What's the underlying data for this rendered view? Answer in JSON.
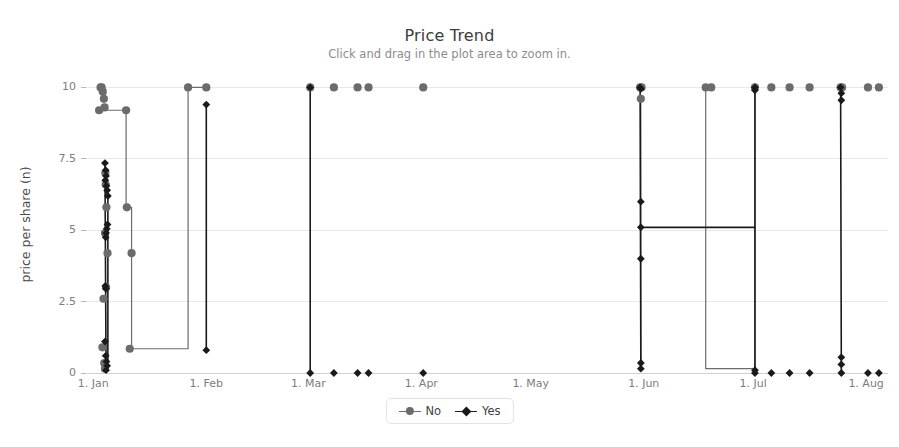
{
  "chart_data": {
    "type": "line",
    "title": "Price Trend",
    "subtitle": "Click and drag in the plot area to zoom in.",
    "xlabel": "",
    "ylabel": "price per share (n)",
    "ylim": [
      0,
      10.4
    ],
    "yticks": [
      0,
      2.5,
      5,
      7.5,
      10
    ],
    "ytick_labels": [
      "0",
      "2.5",
      "5",
      "7.5",
      "10"
    ],
    "xticks": [
      0,
      31,
      59,
      90,
      120,
      151,
      181,
      212
    ],
    "xtick_labels": [
      "1. Jan",
      "1. Feb",
      "1. Mar",
      "1. Apr",
      "1. May",
      "1. Jun",
      "1. Jul",
      "1. Aug"
    ],
    "xlim": [
      -2,
      218
    ],
    "grid": true,
    "grid_axis": "y",
    "legend_position": "bottom-center",
    "colors": {
      "No": "#6b6b6b",
      "Yes": "#1a1a1a",
      "gridline": "#e8e8e8",
      "axis": "#d0d0d0",
      "tick_label": "#7d7d7d",
      "title": "#3c3c3c",
      "subtitle": "#8c8c8c",
      "background": "#ffffff"
    },
    "markers": {
      "No": "circle",
      "Yes": "diamond"
    },
    "series": [
      {
        "name": "No",
        "color": "#6b6b6b",
        "marker": "circle",
        "points": [
          [
            2.0,
            10.0
          ],
          [
            2.3,
            10.0
          ],
          [
            2.6,
            9.85
          ],
          [
            2.9,
            9.6
          ],
          [
            3.1,
            9.3
          ],
          [
            1.6,
            9.2
          ],
          [
            3.3,
            7.0
          ],
          [
            3.4,
            6.6
          ],
          [
            3.6,
            5.8
          ],
          [
            3.2,
            4.9
          ],
          [
            3.9,
            4.2
          ],
          [
            3.5,
            3.0
          ],
          [
            2.8,
            2.6
          ],
          [
            2.5,
            0.9
          ],
          [
            3.0,
            0.35
          ],
          [
            3.2,
            0.15
          ],
          [
            9.0,
            9.2
          ],
          [
            9.2,
            5.8
          ],
          [
            10.5,
            4.2
          ],
          [
            10.0,
            0.85
          ],
          [
            26.0,
            10.0
          ],
          [
            31.0,
            10.0
          ],
          [
            59.5,
            10.0
          ],
          [
            66.0,
            10.0
          ],
          [
            72.5,
            10.0
          ],
          [
            75.5,
            10.0
          ],
          [
            90.5,
            10.0
          ],
          [
            150.0,
            10.0
          ],
          [
            150.4,
            10.0
          ],
          [
            150.2,
            9.6
          ],
          [
            168.0,
            10.0
          ],
          [
            169.5,
            10.0
          ],
          [
            181.5,
            10.0
          ],
          [
            186.0,
            10.0
          ],
          [
            191.0,
            10.0
          ],
          [
            196.5,
            10.0
          ],
          [
            205.0,
            10.0
          ],
          [
            205.4,
            10.0
          ],
          [
            212.5,
            10.0
          ],
          [
            215.5,
            10.0
          ]
        ],
        "lines": [
          [
            [
              1.6,
              9.2
            ],
            [
              9.0,
              9.2
            ],
            [
              9.0,
              5.8
            ],
            [
              9.2,
              5.8
            ]
          ],
          [
            [
              9.2,
              5.8
            ],
            [
              10.5,
              5.8
            ],
            [
              10.5,
              4.2
            ],
            [
              10.5,
              0.85
            ],
            [
              26.0,
              0.85
            ],
            [
              26.0,
              10.0
            ],
            [
              31.0,
              10.0
            ]
          ],
          [
            [
              150.2,
              9.6
            ],
            [
              150.2,
              0.3
            ]
          ],
          [
            [
              168.0,
              10.0
            ],
            [
              168.0,
              0.15
            ],
            [
              181.5,
              0.15
            ],
            [
              181.5,
              10.0
            ]
          ]
        ]
      },
      {
        "name": "Yes",
        "color": "#1a1a1a",
        "marker": "diamond",
        "points": [
          [
            3.2,
            7.35
          ],
          [
            3.4,
            7.1
          ],
          [
            3.5,
            6.9
          ],
          [
            3.3,
            6.75
          ],
          [
            3.6,
            6.55
          ],
          [
            3.8,
            6.4
          ],
          [
            4.0,
            6.2
          ],
          [
            3.9,
            5.2
          ],
          [
            3.7,
            5.05
          ],
          [
            3.5,
            4.9
          ],
          [
            3.4,
            4.75
          ],
          [
            3.3,
            3.05
          ],
          [
            3.5,
            2.95
          ],
          [
            3.2,
            1.1
          ],
          [
            3.4,
            0.6
          ],
          [
            3.6,
            0.4
          ],
          [
            3.8,
            0.25
          ],
          [
            3.5,
            0.1
          ],
          [
            31.0,
            9.4
          ],
          [
            31.0,
            0.8
          ],
          [
            59.5,
            10.0
          ],
          [
            59.5,
            0.0
          ],
          [
            66.0,
            0.0
          ],
          [
            72.5,
            0.0
          ],
          [
            75.5,
            0.0
          ],
          [
            90.5,
            0.0
          ],
          [
            150.0,
            10.0
          ],
          [
            150.2,
            9.95
          ],
          [
            150.2,
            6.0
          ],
          [
            150.2,
            5.1
          ],
          [
            150.2,
            4.0
          ],
          [
            150.2,
            0.35
          ],
          [
            150.2,
            0.15
          ],
          [
            181.5,
            10.0
          ],
          [
            181.5,
            9.9
          ],
          [
            181.5,
            0.1
          ],
          [
            181.5,
            0.0
          ],
          [
            186.0,
            0.0
          ],
          [
            191.0,
            0.0
          ],
          [
            196.5,
            0.0
          ],
          [
            205.0,
            10.0
          ],
          [
            205.2,
            9.8
          ],
          [
            205.2,
            9.55
          ],
          [
            205.2,
            0.55
          ],
          [
            205.2,
            0.3
          ],
          [
            205.2,
            0.0
          ],
          [
            212.5,
            0.0
          ],
          [
            215.5,
            0.0
          ]
        ],
        "lines": [
          [
            [
              3.2,
              7.35
            ],
            [
              3.5,
              0.1
            ]
          ],
          [
            [
              4.0,
              6.2
            ],
            [
              4.0,
              0.25
            ]
          ],
          [
            [
              31.0,
              9.4
            ],
            [
              31.0,
              0.8
            ]
          ],
          [
            [
              59.5,
              10.0
            ],
            [
              59.5,
              0.0
            ]
          ],
          [
            [
              150.0,
              10.0
            ],
            [
              150.2,
              0.15
            ]
          ],
          [
            [
              150.2,
              5.1
            ],
            [
              181.5,
              5.1
            ]
          ],
          [
            [
              181.5,
              10.0
            ],
            [
              181.5,
              0.0
            ]
          ],
          [
            [
              205.0,
              10.0
            ],
            [
              205.2,
              0.0
            ]
          ]
        ]
      }
    ],
    "legend": [
      {
        "label": "No",
        "color": "#6b6b6b",
        "marker": "circle"
      },
      {
        "label": "Yes",
        "color": "#1a1a1a",
        "marker": "diamond"
      }
    ]
  }
}
